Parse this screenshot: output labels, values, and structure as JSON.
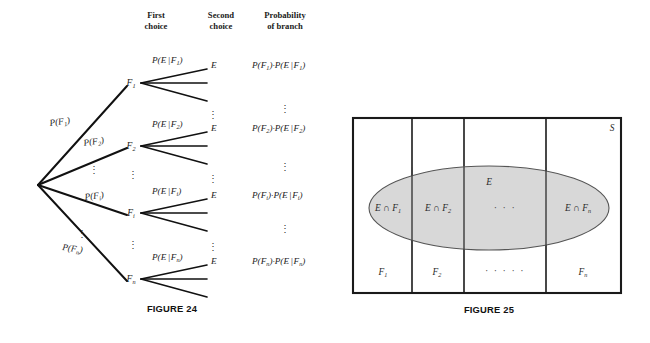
{
  "page": {
    "background": "#ffffff",
    "width": 650,
    "height": 343
  },
  "figure24": {
    "caption": "FIGURE 24",
    "headers": [
      {
        "line1": "First",
        "line2": "choice"
      },
      {
        "line1": "Second",
        "line2": "choice"
      },
      {
        "line1": "Probability",
        "line2": "of branch"
      }
    ],
    "root_label": "",
    "branches": [
      {
        "first_prob": "P(F",
        "first_prob_sub": "1",
        "first_prob_close": ")",
        "node": "F",
        "node_sub": "1",
        "second_prob_pre": "P(E",
        "second_prob_bar": "|",
        "second_prob_f": "F",
        "second_prob_sub": "1",
        "second_prob_close": ")",
        "outcome": "E",
        "branch_prob_a": "P(F",
        "branch_prob_a_sub": "1",
        "branch_prob_mid": ")·P(E",
        "branch_prob_bar": "|",
        "branch_prob_f": "F",
        "branch_prob_b_sub": "1",
        "branch_prob_close": ")"
      },
      {
        "first_prob": "P(F",
        "first_prob_sub": "2",
        "first_prob_close": ")",
        "node": "F",
        "node_sub": "2",
        "second_prob_pre": "P(E",
        "second_prob_bar": "|",
        "second_prob_f": "F",
        "second_prob_sub": "2",
        "second_prob_close": ")",
        "outcome": "E",
        "branch_prob_a": "P(F",
        "branch_prob_a_sub": "2",
        "branch_prob_mid": ")·P(E",
        "branch_prob_bar": "|",
        "branch_prob_f": "F",
        "branch_prob_b_sub": "2",
        "branch_prob_close": ")"
      },
      {
        "first_prob": "P(F",
        "first_prob_sub": "i",
        "first_prob_close": ")",
        "node": "F",
        "node_sub": "i",
        "second_prob_pre": "P(E",
        "second_prob_bar": "|",
        "second_prob_f": "F",
        "second_prob_sub": "i",
        "second_prob_close": ")",
        "outcome": "E",
        "branch_prob_a": "P(F",
        "branch_prob_a_sub": "i",
        "branch_prob_mid": ")·P(E",
        "branch_prob_bar": "|",
        "branch_prob_f": "F",
        "branch_prob_b_sub": "i",
        "branch_prob_close": ")"
      },
      {
        "first_prob": "P(F",
        "first_prob_sub": "n",
        "first_prob_close": ")",
        "node": "F",
        "node_sub": "n",
        "second_prob_pre": "P(E",
        "second_prob_bar": "|",
        "second_prob_f": "F",
        "second_prob_sub": "n",
        "second_prob_close": ")",
        "outcome": "E",
        "branch_prob_a": "P(F",
        "branch_prob_a_sub": "n",
        "branch_prob_mid": ")·P(E",
        "branch_prob_bar": "|",
        "branch_prob_f": "F",
        "branch_prob_b_sub": "n",
        "branch_prob_close": ")"
      }
    ],
    "vertical_dots": "⋮"
  },
  "figure25": {
    "caption": "FIGURE 25",
    "sample_space_label": "S",
    "event_label": "E",
    "horizontal_dots": "· · ·",
    "horizontal_dots_bottom": "· · · · ·",
    "ellipse_fill": "#d8d8d8",
    "ellipse_stroke": "#555555",
    "partitions": [
      {
        "bottom_label": "F",
        "bottom_sub": "1",
        "intersection_pre": "E ∩ F",
        "intersection_sub": "1"
      },
      {
        "bottom_label": "F",
        "bottom_sub": "2",
        "intersection_pre": "E ∩ F",
        "intersection_sub": "2"
      },
      {
        "bottom_label": "",
        "bottom_sub": "",
        "intersection_pre": "",
        "intersection_sub": ""
      },
      {
        "bottom_label": "F",
        "bottom_sub": "n",
        "intersection_pre": "E ∩ F",
        "intersection_sub": "n"
      }
    ]
  }
}
